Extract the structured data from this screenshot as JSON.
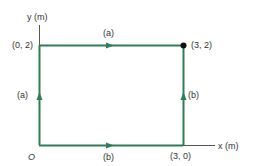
{
  "axes": {
    "y_label": "y (m)",
    "x_label": "x (m)",
    "origin_label": "O"
  },
  "points": {
    "top_left": "(0, 2)",
    "top_right": "(3, 2)",
    "bottom_right": "(3, 0)"
  },
  "paths": {
    "a_top": "(a)",
    "a_left": "(a)",
    "b_bottom": "(b)",
    "b_right": "(b)"
  },
  "colors": {
    "path": "#2e7d5b",
    "axis": "#555555",
    "point": "#111111"
  }
}
